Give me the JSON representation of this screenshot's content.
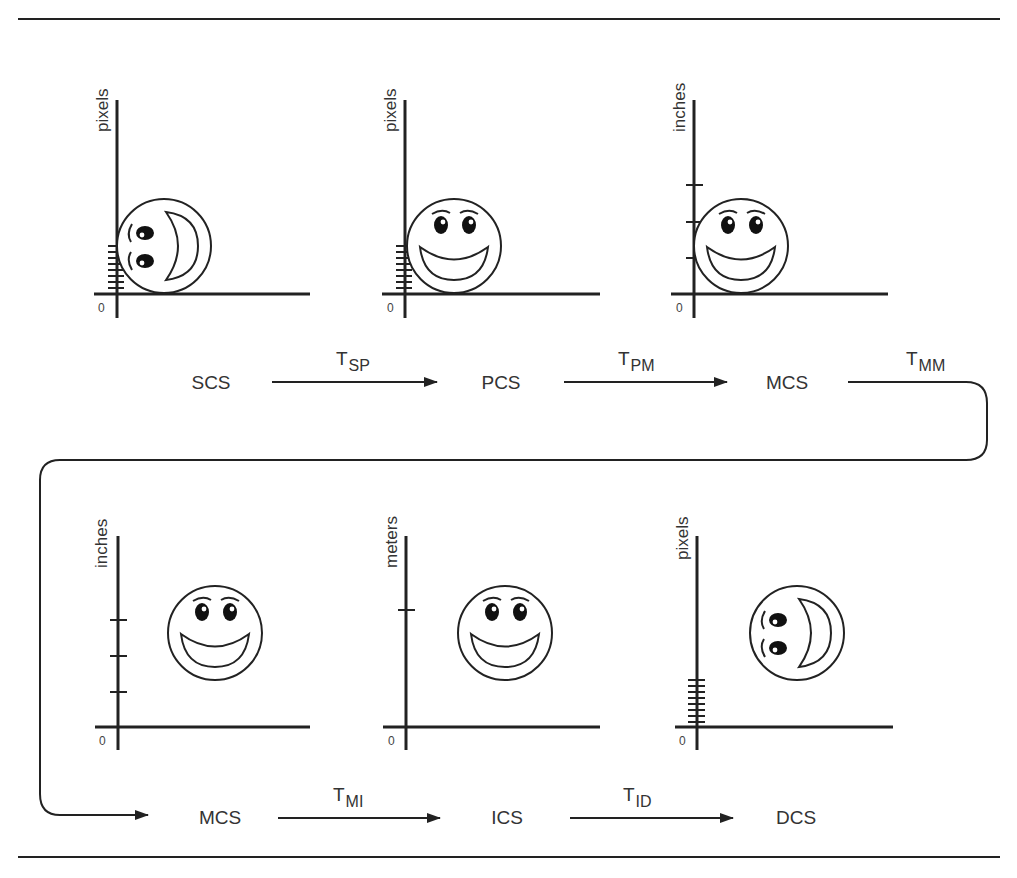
{
  "diagram": {
    "title": "",
    "panels": [
      {
        "id": "scs",
        "axis_unit": "pixels",
        "origin": "0",
        "ticks": "dense-pixel",
        "face_orientation": "rotated-90",
        "label": "SCS"
      },
      {
        "id": "pcs",
        "axis_unit": "pixels",
        "origin": "0",
        "ticks": "dense-pixel",
        "face_orientation": "upright",
        "label": "PCS"
      },
      {
        "id": "mcs1",
        "axis_unit": "inches",
        "origin": "0",
        "ticks": "inch",
        "face_orientation": "upright",
        "label": "MCS"
      },
      {
        "id": "mcs2",
        "axis_unit": "inches",
        "origin": "0",
        "ticks": "inch",
        "face_orientation": "upright",
        "label": "MCS"
      },
      {
        "id": "ics",
        "axis_unit": "meters",
        "origin": "0",
        "ticks": "meter",
        "face_orientation": "upright",
        "label": "ICS"
      },
      {
        "id": "dcs",
        "axis_unit": "pixels",
        "origin": "0",
        "ticks": "dense-pixel",
        "face_orientation": "rotated-90",
        "label": "DCS"
      }
    ],
    "transforms": [
      {
        "from": "SCS",
        "to": "PCS",
        "symbol": "T",
        "sub": "SP"
      },
      {
        "from": "PCS",
        "to": "MCS",
        "symbol": "T",
        "sub": "PM"
      },
      {
        "from": "MCS",
        "to": "MCS",
        "symbol": "T",
        "sub": "MM"
      },
      {
        "from": "MCS",
        "to": "ICS",
        "symbol": "T",
        "sub": "MI"
      },
      {
        "from": "ICS",
        "to": "DCS",
        "symbol": "T",
        "sub": "ID"
      }
    ],
    "colors": {
      "line": "#222222",
      "text": "#333333",
      "background": "#ffffff"
    }
  }
}
